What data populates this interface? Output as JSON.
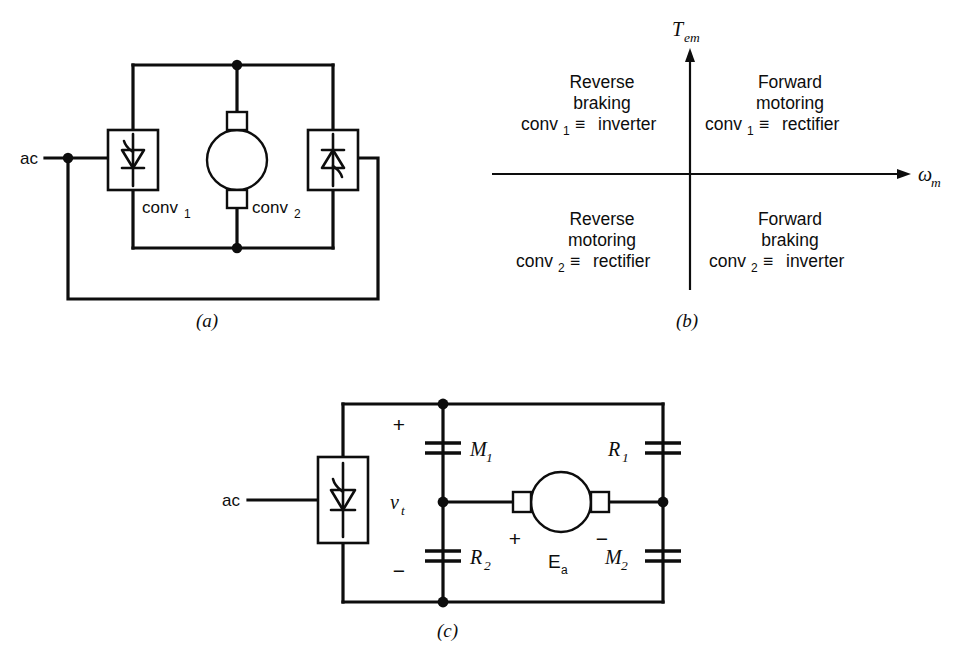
{
  "figure": {
    "panels": [
      {
        "id": "a",
        "caption": "(a)",
        "source_label": "ac",
        "converter_1_label": "conv",
        "converter_1_sub": "1",
        "converter_2_label": "conv",
        "converter_2_sub": "2",
        "machine": "dc-motor"
      },
      {
        "id": "b",
        "caption": "(b)",
        "y_axis_label": "T",
        "y_axis_sub": "em",
        "x_axis_label": "ω",
        "x_axis_sub": "m",
        "quadrants": [
          {
            "position": "quadrant-2",
            "line1": "Reverse",
            "line2": "braking",
            "device": "conv",
            "device_sub": "1",
            "equiv": "≡",
            "mode": "inverter"
          },
          {
            "position": "quadrant-1",
            "line1": "Forward",
            "line2": "motoring",
            "device": "conv",
            "device_sub": "1",
            "equiv": "≡",
            "mode": "rectifier"
          },
          {
            "position": "quadrant-3",
            "line1": "Reverse",
            "line2": "motoring",
            "device": "conv",
            "device_sub": "2",
            "equiv": "≡",
            "mode": "rectifier"
          },
          {
            "position": "quadrant-4",
            "line1": "Forward",
            "line2": "braking",
            "device": "conv",
            "device_sub": "2",
            "equiv": "≡",
            "mode": "inverter"
          }
        ]
      },
      {
        "id": "c",
        "caption": "(c)",
        "source_label": "ac",
        "terminal_voltage": "v",
        "terminal_voltage_sub": "t",
        "terminal_plus": "+",
        "terminal_minus": "−",
        "emf_label": "E",
        "emf_sub": "a",
        "emf_plus": "+",
        "emf_minus": "−",
        "contactors": [
          {
            "name": "M",
            "sub": "1",
            "position": "top-left"
          },
          {
            "name": "R",
            "sub": "1",
            "position": "top-right"
          },
          {
            "name": "R",
            "sub": "2",
            "position": "bottom-left"
          },
          {
            "name": "M",
            "sub": "2",
            "position": "bottom-right"
          }
        ]
      }
    ],
    "bottom_caption": ""
  },
  "colors": {
    "ink": "#0d0d0d",
    "background": "#ffffff"
  }
}
